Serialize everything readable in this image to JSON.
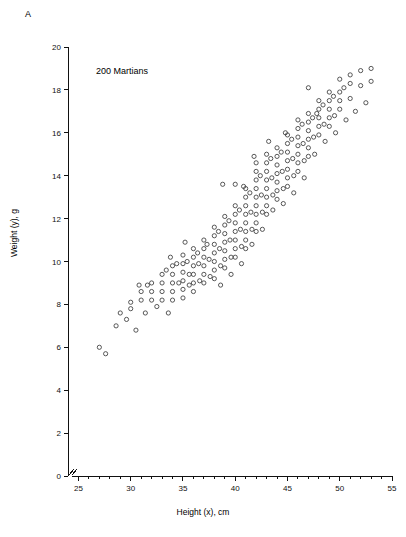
{
  "figure": {
    "panel_label": "A",
    "annotation": "200 Martians"
  },
  "chart_data": {
    "type": "scatter",
    "title": "",
    "annotation": "200 Martians",
    "panel_label": "A",
    "xlabel": "Height (x), cm",
    "ylabel": "Weight (y), g",
    "xlim": [
      24,
      55
    ],
    "ylim": [
      0,
      20
    ],
    "xticks": [
      25,
      30,
      35,
      40,
      45,
      50,
      55
    ],
    "yticks": [
      0,
      2,
      4,
      6,
      8,
      10,
      12,
      14,
      16,
      18,
      20
    ],
    "x_minor_tick_interval": 1,
    "grid": false,
    "legend": null,
    "axis_break_at_origin": true,
    "marker": "open-circle",
    "marker_color": "#3b3b3b",
    "n_points": 200,
    "points": [
      [
        27,
        6.0
      ],
      [
        27.6,
        5.7
      ],
      [
        29,
        7.6
      ],
      [
        29.6,
        7.3
      ],
      [
        30,
        8.1
      ],
      [
        30,
        7.8
      ],
      [
        30.5,
        6.8
      ],
      [
        31,
        8.6
      ],
      [
        31,
        8.2
      ],
      [
        31.4,
        7.6
      ],
      [
        31.6,
        8.9
      ],
      [
        32,
        9.0
      ],
      [
        32,
        8.6
      ],
      [
        32,
        8.2
      ],
      [
        32.5,
        7.9
      ],
      [
        33,
        9.4
      ],
      [
        33,
        9.0
      ],
      [
        33,
        8.6
      ],
      [
        33,
        8.2
      ],
      [
        33.4,
        9.6
      ],
      [
        33.6,
        7.6
      ],
      [
        34,
        9.8
      ],
      [
        34,
        9.4
      ],
      [
        34,
        9.0
      ],
      [
        34,
        8.6
      ],
      [
        34,
        8.2
      ],
      [
        34.4,
        9.9
      ],
      [
        34.6,
        9.0
      ],
      [
        35,
        10.3
      ],
      [
        35,
        9.9
      ],
      [
        35,
        9.5
      ],
      [
        35,
        9.1
      ],
      [
        35,
        8.7
      ],
      [
        35,
        8.3
      ],
      [
        35.4,
        10.0
      ],
      [
        35.6,
        9.4
      ],
      [
        35.6,
        8.9
      ],
      [
        36,
        10.6
      ],
      [
        36,
        10.2
      ],
      [
        36,
        9.8
      ],
      [
        36,
        9.4
      ],
      [
        36,
        9.0
      ],
      [
        36,
        8.6
      ],
      [
        36.4,
        10.4
      ],
      [
        36.5,
        9.9
      ],
      [
        36.6,
        9.1
      ],
      [
        37,
        11.0
      ],
      [
        37,
        10.6
      ],
      [
        37,
        10.2
      ],
      [
        37,
        9.8
      ],
      [
        37,
        9.4
      ],
      [
        37,
        9.0
      ],
      [
        37.3,
        10.8
      ],
      [
        37.5,
        10.1
      ],
      [
        37.6,
        9.3
      ],
      [
        38,
        11.6
      ],
      [
        38,
        11.2
      ],
      [
        38,
        10.8
      ],
      [
        38,
        10.4
      ],
      [
        38,
        10.0
      ],
      [
        38,
        9.6
      ],
      [
        38,
        9.2
      ],
      [
        38.4,
        11.4
      ],
      [
        38.5,
        10.6
      ],
      [
        38.6,
        9.8
      ],
      [
        38.6,
        8.9
      ],
      [
        39,
        12.1
      ],
      [
        39,
        11.7
      ],
      [
        39,
        11.3
      ],
      [
        39,
        10.9
      ],
      [
        39,
        10.5
      ],
      [
        39,
        10.1
      ],
      [
        39,
        9.7
      ],
      [
        39.4,
        11.9
      ],
      [
        39.5,
        11.0
      ],
      [
        39.6,
        10.2
      ],
      [
        39.6,
        9.4
      ],
      [
        40,
        13.6
      ],
      [
        40,
        12.6
      ],
      [
        40,
        12.2
      ],
      [
        40,
        11.8
      ],
      [
        40,
        11.4
      ],
      [
        40,
        11.0
      ],
      [
        40,
        10.6
      ],
      [
        40,
        10.2
      ],
      [
        40.4,
        12.4
      ],
      [
        40.5,
        11.5
      ],
      [
        40.6,
        10.7
      ],
      [
        40.6,
        9.9
      ],
      [
        41,
        13.4
      ],
      [
        41,
        13.0
      ],
      [
        41,
        12.6
      ],
      [
        41,
        12.2
      ],
      [
        41,
        11.8
      ],
      [
        41,
        11.4
      ],
      [
        41,
        11.0
      ],
      [
        41,
        10.6
      ],
      [
        41.4,
        13.2
      ],
      [
        41.5,
        12.3
      ],
      [
        41.6,
        11.5
      ],
      [
        41.6,
        10.8
      ],
      [
        42,
        14.6
      ],
      [
        42,
        14.2
      ],
      [
        42,
        13.8
      ],
      [
        42,
        13.4
      ],
      [
        42,
        13.0
      ],
      [
        42,
        12.6
      ],
      [
        42,
        12.2
      ],
      [
        42,
        11.8
      ],
      [
        42,
        11.4
      ],
      [
        42.4,
        14.0
      ],
      [
        42.5,
        13.1
      ],
      [
        42.6,
        12.3
      ],
      [
        42.6,
        11.5
      ],
      [
        43,
        15.0
      ],
      [
        43,
        14.6
      ],
      [
        43,
        14.2
      ],
      [
        43,
        13.8
      ],
      [
        43,
        13.4
      ],
      [
        43,
        13.0
      ],
      [
        43,
        12.6
      ],
      [
        43,
        12.2
      ],
      [
        43.4,
        14.8
      ],
      [
        43.5,
        13.9
      ],
      [
        43.6,
        13.1
      ],
      [
        43.6,
        12.4
      ],
      [
        44,
        15.3
      ],
      [
        44,
        14.9
      ],
      [
        44,
        14.5
      ],
      [
        44,
        14.1
      ],
      [
        44,
        13.7
      ],
      [
        44,
        13.3
      ],
      [
        44,
        12.9
      ],
      [
        44.4,
        15.1
      ],
      [
        44.5,
        14.2
      ],
      [
        44.6,
        13.4
      ],
      [
        44.6,
        12.7
      ],
      [
        45,
        15.9
      ],
      [
        45,
        15.5
      ],
      [
        45,
        15.1
      ],
      [
        45,
        14.7
      ],
      [
        45,
        14.3
      ],
      [
        45,
        13.9
      ],
      [
        45,
        13.5
      ],
      [
        45.4,
        15.7
      ],
      [
        45.5,
        14.8
      ],
      [
        45.6,
        14.0
      ],
      [
        45.6,
        13.2
      ],
      [
        46,
        16.6
      ],
      [
        46,
        16.2
      ],
      [
        46,
        15.8
      ],
      [
        46,
        15.4
      ],
      [
        46,
        15.0
      ],
      [
        46,
        14.6
      ],
      [
        46,
        14.2
      ],
      [
        46.4,
        16.4
      ],
      [
        46.5,
        15.5
      ],
      [
        46.6,
        14.7
      ],
      [
        46.6,
        13.9
      ],
      [
        47,
        18.1
      ],
      [
        47,
        16.9
      ],
      [
        47,
        16.5
      ],
      [
        47,
        16.1
      ],
      [
        47,
        15.7
      ],
      [
        47,
        15.3
      ],
      [
        47,
        14.9
      ],
      [
        47.4,
        16.7
      ],
      [
        47.5,
        15.8
      ],
      [
        47.6,
        15.0
      ],
      [
        48,
        17.5
      ],
      [
        48,
        17.1
      ],
      [
        48,
        16.7
      ],
      [
        48,
        16.3
      ],
      [
        48,
        15.9
      ],
      [
        48.4,
        17.3
      ],
      [
        48.5,
        16.4
      ],
      [
        48.6,
        15.6
      ],
      [
        49,
        17.9
      ],
      [
        49,
        17.5
      ],
      [
        49,
        17.1
      ],
      [
        49,
        16.7
      ],
      [
        49,
        16.3
      ],
      [
        49.4,
        17.7
      ],
      [
        49.5,
        16.8
      ],
      [
        49.6,
        16.0
      ],
      [
        50,
        18.5
      ],
      [
        50,
        17.9
      ],
      [
        50,
        17.5
      ],
      [
        50,
        17.1
      ],
      [
        50.4,
        18.1
      ],
      [
        50.6,
        16.6
      ],
      [
        51,
        18.7
      ],
      [
        51,
        18.3
      ],
      [
        51,
        17.6
      ],
      [
        51.5,
        17.0
      ],
      [
        52,
        18.9
      ],
      [
        52,
        18.2
      ],
      [
        52.5,
        17.4
      ],
      [
        53,
        19.0
      ],
      [
        53,
        18.4
      ],
      [
        38.8,
        13.6
      ],
      [
        40.8,
        13.5
      ],
      [
        35.2,
        10.9
      ],
      [
        33.8,
        10.2
      ],
      [
        30.8,
        8.9
      ],
      [
        28.6,
        7.0
      ],
      [
        43.2,
        15.6
      ],
      [
        44.8,
        16.0
      ],
      [
        47.8,
        16.9
      ],
      [
        41.8,
        14.9
      ]
    ]
  }
}
